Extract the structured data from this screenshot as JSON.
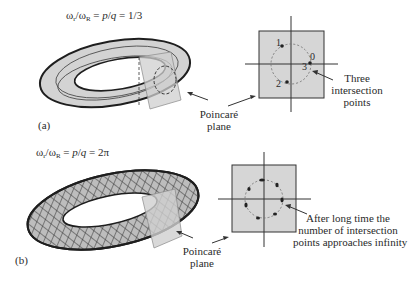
{
  "panel_a": {
    "label": "(a)",
    "formula": {
      "omega1": "ω",
      "sub1": "r",
      "slash": "/",
      "omega2": "ω",
      "sub2": "R",
      "rest_eq1": " = ",
      "p": "p",
      "slash2": "/",
      "q": "q",
      "rest_eq2": " = ",
      "value": "1/3"
    },
    "poincare_label_line1": "Poincaré",
    "poincare_label_line2": "plane",
    "section_points": [
      "1",
      "0",
      "3",
      "2"
    ],
    "annotation_line1": "Three",
    "annotation_line2": "intersection",
    "annotation_line3": "points"
  },
  "panel_b": {
    "label": "(b)",
    "formula": {
      "omega1": "ω",
      "sub1": "r",
      "slash": "/",
      "omega2": "ω",
      "sub2": "R",
      "rest_eq1": " = ",
      "p": "p",
      "slash2": "/",
      "q": "q",
      "rest_eq2": " = ",
      "value": "2π"
    },
    "poincare_label_line1": "Poincaré",
    "poincare_label_line2": "plane",
    "annotation_line1": "After long time the",
    "annotation_line2": "number of intersection",
    "annotation_line3": "points approaches infinity"
  },
  "colors": {
    "torus_fill": "#cfcfcf",
    "plane_fill": "#d9d9d9",
    "section_fill": "#d6d6d6",
    "line": "#2a2a2a"
  }
}
